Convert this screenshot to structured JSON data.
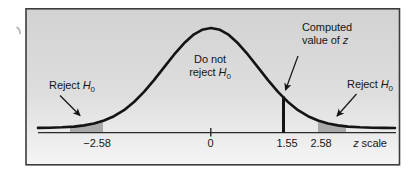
{
  "labels": {
    "reject_left": {
      "text": "Reject",
      "hyp": "H",
      "sub": "0"
    },
    "reject_right": {
      "text": "Reject",
      "hyp": "H",
      "sub": "0"
    },
    "do_not_reject": {
      "line1": "Do not",
      "line2": "reject",
      "hyp": "H",
      "sub": "0"
    },
    "computed_z": {
      "line1": "Computed",
      "line2": "value of",
      "var": "z"
    },
    "z_scale": {
      "var": "z",
      "text": "scale"
    }
  },
  "axis_ticks": {
    "neg_critical": "−2.58",
    "zero": "0",
    "computed": "1.55",
    "pos_critical": "2.58"
  },
  "curve": {
    "shape": "standard normal distribution",
    "x_tick_values": [
      -2.58,
      0,
      1.55,
      2.58
    ],
    "computed_z_marker": 1.55,
    "shaded_rejection_regions": [
      {
        "side": "left",
        "beyond": -2.58
      },
      {
        "side": "right",
        "beyond": 2.58
      }
    ]
  },
  "colors": {
    "region_fill": "#a9a9a9",
    "curve_stroke": "#141414",
    "box_border": "#3c3c3c",
    "axis_stroke": "#2a2a2a",
    "bg_top": "#d2d2d2",
    "bg_mid": "#dedede",
    "bg_bottom": "#f5f5f5"
  }
}
